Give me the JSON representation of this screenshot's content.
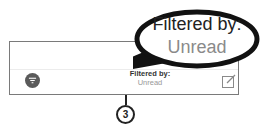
{
  "toolbar": {
    "filter_icon": "filter-icon",
    "status_line1": "Filtered by:",
    "status_line2": "Unread",
    "compose_icon": "compose-icon"
  },
  "callout": {
    "line1": "Filtered by:",
    "line2": "Unread"
  },
  "annotation": {
    "badge": "3"
  },
  "colors": {
    "filter_button": "#5a5a5a",
    "status_secondary": "#999999",
    "callout_outline": "#111111"
  }
}
